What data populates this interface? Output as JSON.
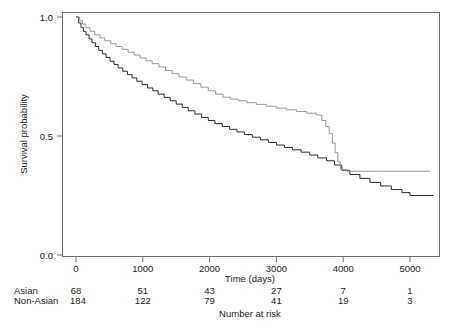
{
  "chart_data": {
    "type": "line",
    "title": "",
    "subtitle": "",
    "xlabel": "Time (days)",
    "ylabel": "Survival probability",
    "xlim": [
      -120,
      5600
    ],
    "ylim": [
      0.0,
      1.0
    ],
    "grid": false,
    "legend_position": "none",
    "xticks": [
      0,
      1000,
      2000,
      3000,
      4000,
      5000
    ],
    "xtick_labels": [
      "0",
      "1000",
      "2000",
      "3000",
      "4000",
      "5000"
    ],
    "yticks": [
      0.0,
      0.5,
      1.0
    ],
    "ytick_labels": [
      "0.0",
      "0.5",
      "1.0"
    ],
    "annotation": "Number at risk",
    "series": [
      {
        "name": "Asian",
        "color": "#9a9a9a",
        "style": "solid-light",
        "points": [
          [
            0,
            1.0
          ],
          [
            55,
            0.985
          ],
          [
            95,
            0.97
          ],
          [
            150,
            0.955
          ],
          [
            210,
            0.94
          ],
          [
            280,
            0.925
          ],
          [
            360,
            0.912
          ],
          [
            430,
            0.9
          ],
          [
            520,
            0.888
          ],
          [
            600,
            0.876
          ],
          [
            690,
            0.864
          ],
          [
            780,
            0.852
          ],
          [
            870,
            0.84
          ],
          [
            960,
            0.828
          ],
          [
            1050,
            0.816
          ],
          [
            1140,
            0.804
          ],
          [
            1240,
            0.79
          ],
          [
            1340,
            0.775
          ],
          [
            1440,
            0.762
          ],
          [
            1540,
            0.748
          ],
          [
            1650,
            0.735
          ],
          [
            1760,
            0.72
          ],
          [
            1870,
            0.705
          ],
          [
            1980,
            0.69
          ],
          [
            2090,
            0.676
          ],
          [
            2200,
            0.663
          ],
          [
            2310,
            0.655
          ],
          [
            2430,
            0.648
          ],
          [
            2560,
            0.64
          ],
          [
            2700,
            0.633
          ],
          [
            2850,
            0.625
          ],
          [
            3000,
            0.617
          ],
          [
            3150,
            0.61
          ],
          [
            3300,
            0.603
          ],
          [
            3450,
            0.596
          ],
          [
            3600,
            0.588
          ],
          [
            3680,
            0.565
          ],
          [
            3740,
            0.54
          ],
          [
            3790,
            0.51
          ],
          [
            3840,
            0.47
          ],
          [
            3880,
            0.43
          ],
          [
            3920,
            0.39
          ],
          [
            3960,
            0.36
          ],
          [
            4050,
            0.352
          ],
          [
            4600,
            0.352
          ],
          [
            5300,
            0.352
          ]
        ]
      },
      {
        "name": "Non-Asian",
        "color": "#2b2b2b",
        "style": "solid-dark",
        "points": [
          [
            0,
            1.0
          ],
          [
            40,
            0.975
          ],
          [
            75,
            0.955
          ],
          [
            110,
            0.94
          ],
          [
            150,
            0.925
          ],
          [
            195,
            0.908
          ],
          [
            240,
            0.892
          ],
          [
            290,
            0.876
          ],
          [
            340,
            0.86
          ],
          [
            395,
            0.845
          ],
          [
            450,
            0.83
          ],
          [
            510,
            0.814
          ],
          [
            570,
            0.8
          ],
          [
            630,
            0.786
          ],
          [
            700,
            0.772
          ],
          [
            770,
            0.758
          ],
          [
            840,
            0.744
          ],
          [
            910,
            0.73
          ],
          [
            990,
            0.716
          ],
          [
            1070,
            0.702
          ],
          [
            1150,
            0.69
          ],
          [
            1230,
            0.676
          ],
          [
            1320,
            0.662
          ],
          [
            1410,
            0.648
          ],
          [
            1500,
            0.634
          ],
          [
            1590,
            0.62
          ],
          [
            1680,
            0.606
          ],
          [
            1780,
            0.592
          ],
          [
            1880,
            0.578
          ],
          [
            1980,
            0.565
          ],
          [
            2080,
            0.552
          ],
          [
            2190,
            0.54
          ],
          [
            2300,
            0.528
          ],
          [
            2410,
            0.517
          ],
          [
            2520,
            0.506
          ],
          [
            2640,
            0.495
          ],
          [
            2760,
            0.484
          ],
          [
            2880,
            0.473
          ],
          [
            3000,
            0.462
          ],
          [
            3120,
            0.452
          ],
          [
            3240,
            0.442
          ],
          [
            3370,
            0.432
          ],
          [
            3500,
            0.42
          ],
          [
            3620,
            0.408
          ],
          [
            3750,
            0.396
          ],
          [
            3870,
            0.378
          ],
          [
            3980,
            0.356
          ],
          [
            4100,
            0.338
          ],
          [
            4250,
            0.322
          ],
          [
            4400,
            0.305
          ],
          [
            4560,
            0.29
          ],
          [
            4720,
            0.275
          ],
          [
            4880,
            0.262
          ],
          [
            5000,
            0.25
          ],
          [
            5150,
            0.25
          ],
          [
            5350,
            0.25
          ]
        ]
      }
    ]
  },
  "risk_table": {
    "caption": "Number at risk",
    "time_points": [
      0,
      1000,
      2000,
      3000,
      4000,
      5000
    ],
    "rows": [
      {
        "label": "Asian",
        "values": [
          "68",
          "51",
          "43",
          "27",
          "7",
          "1"
        ]
      },
      {
        "label": "Non-Asian",
        "values": [
          "184",
          "122",
          "79",
          "41",
          "19",
          "3"
        ]
      }
    ]
  }
}
